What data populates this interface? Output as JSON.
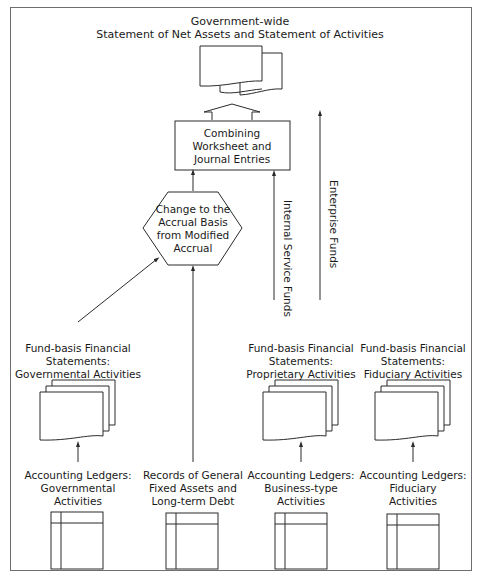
{
  "diagram": {
    "title": {
      "line1": "Government-wide",
      "line2": "Statement of Net Assets and Statement of Activities"
    },
    "combining_box": {
      "line1": "Combining",
      "line2": "Worksheet and",
      "line3": "Journal Entries"
    },
    "hexagon": {
      "line1": "Change to the",
      "line2": "Accrual Basis",
      "line3": "from Modified",
      "line4": "Accrual"
    },
    "flow_labels": {
      "internal_service": "Internal Service Funds",
      "enterprise": "Enterprise Funds"
    },
    "fund_statements": [
      {
        "line1": "Fund-basis Financial",
        "line2": "Statements:",
        "line3": "Governmental Activities"
      },
      {
        "line1": "Fund-basis Financial",
        "line2": "Statements:",
        "line3": "Proprietary Activities"
      },
      {
        "line1": "Fund-basis Financial",
        "line2": "Statements:",
        "line3": "Fiduciary Activities"
      }
    ],
    "sources": [
      {
        "line1": "Accounting Ledgers:",
        "line2": "Governmental",
        "line3": "Activities"
      },
      {
        "line1": "Records of General",
        "line2": "Fixed Assets and",
        "line3": "Long-term Debt"
      },
      {
        "line1": "Accounting Ledgers:",
        "line2": "Business-type",
        "line3": "Activities"
      },
      {
        "line1": "Accounting Ledgers:",
        "line2": "Fiduciary",
        "line3": "Activities"
      }
    ],
    "colors": {
      "line": "#2a2a2a",
      "frame": "#6e6e6e",
      "background": "#ffffff"
    }
  }
}
